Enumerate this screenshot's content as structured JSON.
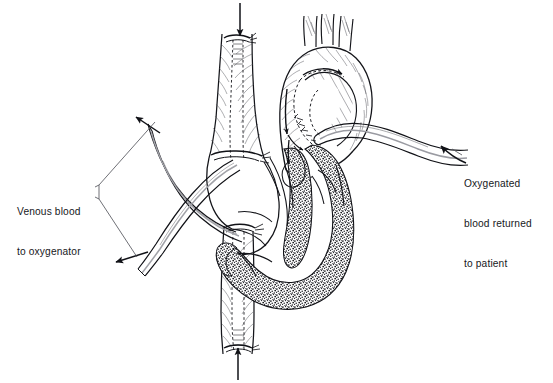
{
  "figure": {
    "background_color": "#ffffff",
    "ink_color": "#14151a",
    "myocardium_fill": "#6f6f72",
    "width": 553,
    "height": 383
  },
  "callouts": {
    "venous": {
      "name": "venous-blood-label",
      "lines": [
        "Venous blood",
        "to oxygenator"
      ],
      "line1": "Venous blood",
      "line2": "to oxygenator",
      "position": "left",
      "leader": "bracket-forked"
    },
    "arterial": {
      "name": "oxygenated-blood-label",
      "lines": [
        "Oxygenated",
        "blood returned",
        "to patient"
      ],
      "line1": "Oxygenated",
      "line2": "blood returned",
      "line3": "to patient",
      "position": "right",
      "leader": "curved-arrow"
    }
  },
  "anatomy": {
    "structures": [
      {
        "name": "aortic-arch",
        "label": "Aortic arch"
      },
      {
        "name": "brachiocephalic-branches",
        "label": "Great vessel branches",
        "count": 3
      },
      {
        "name": "ascending-aorta",
        "label": "Ascending aorta"
      },
      {
        "name": "superior-vena-cava",
        "label": "Superior vena cava"
      },
      {
        "name": "inferior-vena-cava",
        "label": "Inferior vena cava"
      },
      {
        "name": "right-atrium",
        "label": "Right atrium"
      },
      {
        "name": "left-ventricle",
        "label": "Left ventricle"
      },
      {
        "name": "right-ventricle",
        "label": "Right ventricle"
      },
      {
        "name": "interventricular-septum",
        "label": "Interventricular septum"
      },
      {
        "name": "myocardium",
        "label": "Myocardium (stippled wall)"
      }
    ]
  },
  "cannulae": {
    "items": [
      {
        "name": "svc-venous-cannula",
        "label": "Superior vena cava venous cannula"
      },
      {
        "name": "ivc-venous-cannula",
        "label": "Inferior vena cava venous cannula"
      },
      {
        "name": "aortic-arterial-cannula",
        "label": "Aortic arterial return cannula"
      }
    ],
    "ligatures": [
      {
        "name": "svc-upper-ligature"
      },
      {
        "name": "svc-lower-ligature"
      },
      {
        "name": "ivc-upper-ligature"
      },
      {
        "name": "ivc-lower-ligature"
      },
      {
        "name": "aortic-purse-string"
      }
    ]
  },
  "flow_arrows": [
    {
      "name": "svc-inflow-arrow",
      "direction": "down",
      "meaning": "venous blood entering superior vena cava"
    },
    {
      "name": "ivc-inflow-arrow",
      "direction": "up",
      "meaning": "venous blood entering inferior vena cava"
    },
    {
      "name": "venous-drain-upper-arrow",
      "direction": "left",
      "meaning": "venous blood to oxygenator"
    },
    {
      "name": "venous-drain-lower-arrow",
      "direction": "left",
      "meaning": "venous blood to oxygenator"
    },
    {
      "name": "aortic-return-arrow",
      "direction": "up-left",
      "meaning": "oxygenated blood returned to patient"
    },
    {
      "name": "aortic-arch-flow-arrow",
      "direction": "right",
      "meaning": "flow through aortic arch"
    },
    {
      "name": "coronary-flow-arrow-1",
      "direction": "down",
      "meaning": "flow toward heart chambers"
    },
    {
      "name": "coronary-flow-arrow-2",
      "direction": "down-right",
      "meaning": "flow toward heart chambers"
    },
    {
      "name": "coronary-flow-arrow-3",
      "direction": "down",
      "meaning": "flow toward heart chambers"
    }
  ]
}
